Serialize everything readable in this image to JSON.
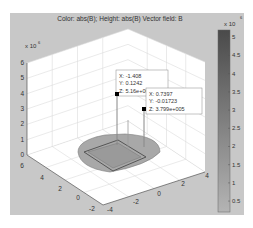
{
  "figure": {
    "background": "#c8c8c8",
    "plot_face": "#ffffff",
    "grid_color": "#dcdcdc"
  },
  "chart_data": {
    "type": "surface3d",
    "title": "Color: abs(B); Height: abs(B)  Vector field: B",
    "z_exponent_label": "x 10",
    "z_exponent": "6",
    "z_ticks": [
      "0",
      "1",
      "2",
      "3",
      "4",
      "5",
      "6"
    ],
    "zlim": [
      0,
      6
    ],
    "y_ticks_left": [
      "6",
      "4",
      "2",
      "0",
      "-2"
    ],
    "x_ticks_right": [
      "-4",
      "-2",
      "0",
      "2",
      "4"
    ],
    "grid": true,
    "data_tips": [
      {
        "x_label": "X: -1.408",
        "y_label": "Y: 0.1242",
        "z_label": "Z: 5.16e+005",
        "x": -1.408,
        "y": 0.1242,
        "z": 516000
      },
      {
        "x_label": "X: 0.7397",
        "y_label": "Y: -0.01723",
        "z_label": "Z: 3.799e+005",
        "x": 0.7397,
        "y": -0.01723,
        "z": 379900
      }
    ],
    "colorbar": {
      "exponent_label": "x 10",
      "exponent": "6",
      "ticks": [
        "5",
        "4.5",
        "4",
        "3.5",
        "3",
        "2.5",
        "2",
        "1.5",
        "1",
        "0.5"
      ],
      "range": [
        0.2,
        5.2
      ],
      "color_top": "#4a4a4a",
      "color_bottom": "#b4b4b4"
    }
  }
}
